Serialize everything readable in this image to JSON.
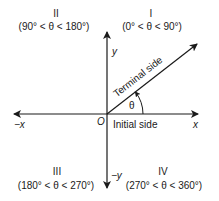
{
  "diagram": {
    "type": "coordinate-plane-angle",
    "quadrants": [
      {
        "id": "I",
        "numeral": "I",
        "range": "(0° < θ < 90°)"
      },
      {
        "id": "II",
        "numeral": "II",
        "range": "(90° < θ < 180°)"
      },
      {
        "id": "III",
        "numeral": "III",
        "range": "(180° < θ < 270°)"
      },
      {
        "id": "IV",
        "numeral": "IV",
        "range": "(270° < θ < 360°)"
      }
    ],
    "axes": {
      "pos_x": "x",
      "neg_x": "−x",
      "pos_y": "y",
      "neg_y": "−y",
      "origin": "O"
    },
    "rays": {
      "terminal": "Terminal side",
      "initial": "Initial side"
    },
    "angle_label": "θ",
    "colors": {
      "line": "#1a1a1a",
      "background": "#ffffff"
    }
  }
}
